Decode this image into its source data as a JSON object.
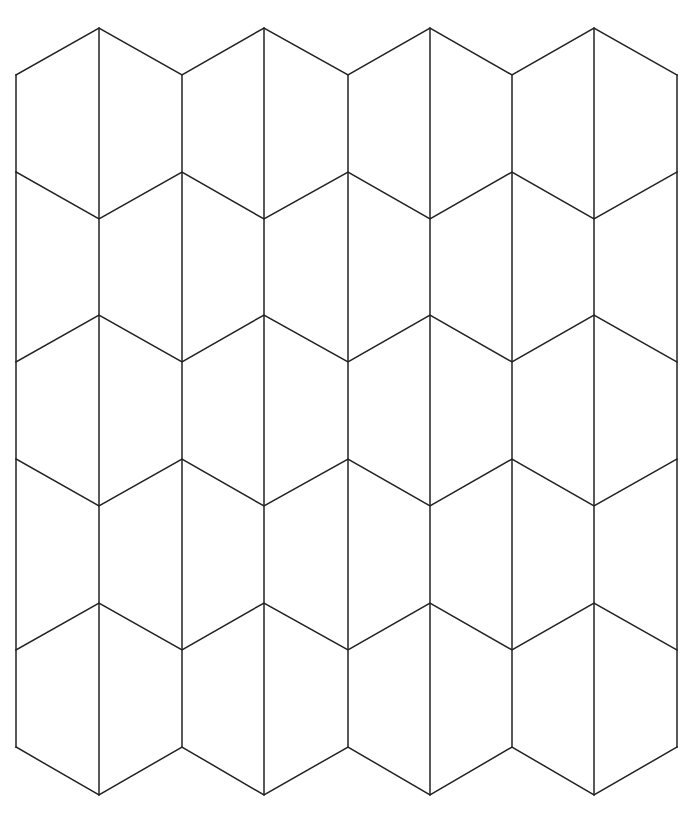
{
  "diagram": {
    "title": "",
    "stroke_color": "#222222",
    "background": "#ffffff",
    "outer_x": [
      16,
      182,
      348,
      512,
      677
    ],
    "inner_x": [
      99,
      264,
      430,
      594
    ],
    "vertical_outer": {
      "y_top": 75,
      "y_bottom": 747
    },
    "vertical_inner": {
      "y_top": 28,
      "y_bottom": 795
    },
    "zigzags": [
      {
        "outer_y": 75,
        "inner_y": 28
      },
      {
        "outer_y": 172,
        "inner_y": 219
      },
      {
        "outer_y": 362,
        "inner_y": 315
      },
      {
        "outer_y": 459,
        "inner_y": 506
      },
      {
        "outer_y": 650,
        "inner_y": 603
      },
      {
        "outer_y": 747,
        "inner_y": 795
      }
    ]
  }
}
